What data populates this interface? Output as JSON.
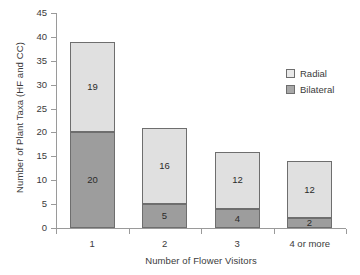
{
  "chart_data": {
    "type": "bar",
    "stacked": true,
    "title": "",
    "xlabel": "Number of Flower Visitors",
    "ylabel": "Number of Plant Taxa (HF and CC)",
    "categories": [
      "1",
      "2",
      "3",
      "4 or more"
    ],
    "series": [
      {
        "name": "Bilateral",
        "values": [
          20,
          5,
          4,
          2
        ],
        "color": "#9d9d9d"
      },
      {
        "name": "Radial",
        "values": [
          19,
          16,
          12,
          12
        ],
        "color": "#e0e0e0"
      }
    ],
    "totals": [
      39,
      21,
      16,
      14
    ],
    "ylim": [
      0,
      45
    ],
    "yticks": [
      0,
      5,
      10,
      15,
      20,
      25,
      30,
      35,
      40,
      45
    ],
    "grid": false,
    "legend_position": "right-top",
    "legend_entries": [
      "Radial",
      "Bilateral"
    ]
  }
}
